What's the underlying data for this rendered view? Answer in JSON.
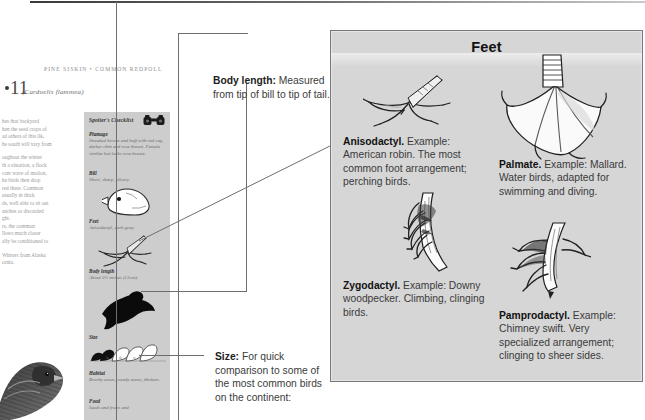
{
  "book_page": {
    "running_head": "PINE SISKIN • COMMON REDPOLL",
    "species_number": "11",
    "species_latin": "(Carduelis flammea)",
    "body_paragraphs": [
      "hes that backyard\nhen the seed crops of\nad others of this ilk,\nhe south will vary from",
      "oughout the winter\nth a situation, a flock\ncant wave of motion,\nhe birds then drop\nred there. Common\nusually in thick\nds, well able to sit out\nanches or discarded\nght.\nrs, the common\nllows much closer\nally be conditioned to",
      "Winters from Alaska\nornia."
    ]
  },
  "checklist": {
    "title": "Spotter's Checklist",
    "binoculars_icon": "binoculars-icon",
    "entries": [
      {
        "heading": "Plumage",
        "text": "Streaked brown and buff with red cap, darker chin and rose breast. Female similar but lacks rose breast."
      },
      {
        "heading": "Bill",
        "text": "Short, sharp, silvery."
      },
      {
        "heading": "Feet",
        "text": "Anisodactyl, dark gray."
      },
      {
        "heading": "Body length",
        "text": "About 5¼ inches (13cm)."
      },
      {
        "heading": "Size",
        "text": ""
      },
      {
        "heading": "Habitat",
        "text": "Brushy areas, weedy areas, thickets."
      },
      {
        "heading": "Food",
        "text": "Seeds and fruits and"
      }
    ]
  },
  "callouts": [
    {
      "label": "Body length:",
      "text": " Measured from tip of bill to tip of tail."
    },
    {
      "label": "Size:",
      "text": " For quick comparison to some of the most common birds on the continent:"
    }
  ],
  "feet_panel": {
    "title": "Feet",
    "background_color": "#d6d6d6",
    "border_color": "#777777",
    "items": [
      {
        "name": "Anisodactyl.",
        "text": " Example: American robin. The most common foot arrangement; perching birds.",
        "art": "anisodactyl-foot-illustration"
      },
      {
        "name": "Palmate.",
        "text": " Example: Mallard. Water birds, adapted for swimming and diving.",
        "art": "palmate-foot-illustration"
      },
      {
        "name": "Zygodactyl.",
        "text": " Example: Downy woodpecker. Climbing, clinging birds.",
        "art": "zygodactyl-foot-illustration"
      },
      {
        "name": "Pamprodactyl.",
        "text": " Example: Chimney swift. Very specialized arrangement; clinging to sheer sides.",
        "art": "pamprodactyl-foot-illustration"
      }
    ]
  }
}
